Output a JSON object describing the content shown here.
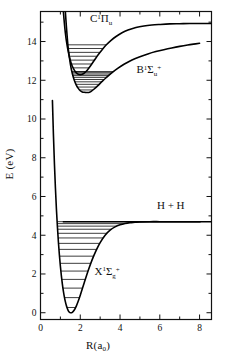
{
  "figure": {
    "kind": "potential-energy-curves",
    "molecule": "H2",
    "background": "#ffffff",
    "line_color": "#000000",
    "level_color": "#1a1a1a"
  },
  "axes": {
    "xlabel_main": "R(a",
    "xlabel_sub": "0",
    "xlabel_close": ")",
    "ylabel": "E (eV)",
    "xticks": [
      0,
      2,
      4,
      6,
      8
    ],
    "xticklabels": [
      "0",
      "2",
      "4",
      "6",
      "8"
    ],
    "yticks": [
      0,
      2,
      4,
      6,
      8,
      10,
      12,
      14
    ],
    "yticklabels": [
      "0",
      "2",
      "4",
      "6",
      "8",
      "10",
      "12",
      "14"
    ],
    "xlim": [
      0,
      8.6
    ],
    "ylim": [
      -0.35,
      15.55
    ],
    "minor_x_step": 1,
    "minor_y_step": 1,
    "grid": false,
    "frame": true
  },
  "annotations": [
    {
      "id": "label-C",
      "base": "C",
      "super": "1",
      "greek": "Π",
      "sub": "u",
      "post": "",
      "x": 3.05,
      "y": 15.0
    },
    {
      "id": "label-B",
      "base": "B",
      "super": "1",
      "greek": "Σ",
      "sub": "u",
      "post": "+",
      "x": 5.45,
      "y": 12.35
    },
    {
      "id": "label-X",
      "base": "X",
      "super": "1",
      "greek": "Σ",
      "sub": "g",
      "post": "+",
      "x": 3.35,
      "y": 1.95
    },
    {
      "id": "label-HH",
      "base": "H + H",
      "super": "",
      "greek": "",
      "sub": "",
      "post": "",
      "x": 6.55,
      "y": 5.35
    }
  ],
  "chart_data": {
    "type": "line",
    "title": "",
    "xlabel": "R(a0)",
    "ylabel": "E (eV)",
    "xlim": [
      0,
      8.6
    ],
    "ylim": [
      -0.35,
      15.55
    ],
    "grid": false,
    "legend": "inline-annotations",
    "series": [
      {
        "name": "X1Sigma_g+",
        "label": "X¹Σₒ⁺",
        "minimum_R": 1.4,
        "minimum_E": 0.0,
        "dissociation_E": 4.7,
        "x": [
          0.6,
          0.65,
          0.7,
          0.75,
          0.8,
          0.85,
          0.9,
          0.95,
          1.0,
          1.05,
          1.1,
          1.15,
          1.2,
          1.25,
          1.3,
          1.35,
          1.4,
          1.45,
          1.5,
          1.6,
          1.7,
          1.8,
          1.9,
          2.0,
          2.2,
          2.4,
          2.6,
          2.8,
          3.0,
          3.25,
          3.5,
          3.75,
          4.0,
          4.25,
          4.5,
          4.75,
          5.0,
          5.5,
          6.0,
          6.5,
          7.0,
          7.5,
          8.0,
          8.6
        ],
        "y": [
          10.95,
          9.2,
          7.7,
          6.45,
          5.35,
          4.45,
          3.65,
          2.98,
          2.4,
          1.9,
          1.48,
          1.12,
          0.82,
          0.57,
          0.37,
          0.22,
          0.1,
          0.03,
          0.0,
          0.02,
          0.14,
          0.34,
          0.6,
          0.9,
          1.55,
          2.18,
          2.74,
          3.22,
          3.62,
          4.0,
          4.26,
          4.43,
          4.54,
          4.61,
          4.65,
          4.67,
          4.69,
          4.7,
          4.7,
          4.7,
          4.7,
          4.7,
          4.7,
          4.7
        ],
        "vibrational_levels": [
          0.27,
          0.78,
          1.27,
          1.72,
          2.15,
          2.55,
          2.92,
          3.27,
          3.58,
          3.86,
          4.1,
          4.31,
          4.47,
          4.6,
          4.7
        ],
        "level_count": 15
      },
      {
        "name": "B1Sigma_u+",
        "label": "B¹Σᵤ⁺",
        "minimum_R": 2.45,
        "minimum_E": 11.38,
        "x": [
          1.25,
          1.3,
          1.35,
          1.4,
          1.5,
          1.6,
          1.7,
          1.8,
          1.9,
          2.0,
          2.1,
          2.2,
          2.3,
          2.4,
          2.45,
          2.55,
          2.7,
          2.9,
          3.1,
          3.3,
          3.6,
          3.9,
          4.2,
          4.6,
          5.0,
          5.4,
          5.8,
          6.2,
          6.6,
          7.0,
          7.4,
          7.8,
          8.0
        ],
        "y": [
          15.55,
          14.8,
          14.15,
          13.6,
          12.85,
          12.35,
          12.0,
          11.75,
          11.58,
          11.46,
          11.4,
          11.38,
          11.37,
          11.37,
          11.38,
          11.43,
          11.55,
          11.74,
          11.94,
          12.13,
          12.4,
          12.63,
          12.83,
          13.05,
          13.22,
          13.36,
          13.48,
          13.58,
          13.67,
          13.75,
          13.82,
          13.88,
          13.91
        ],
        "vibrational_levels": [
          11.5,
          11.65,
          11.79,
          11.92,
          12.04,
          12.15,
          12.24,
          12.32,
          12.39,
          12.45
        ],
        "level_count": 10
      },
      {
        "name": "C1Pi_u",
        "label": "C¹Πᵤ",
        "minimum_R": 2.0,
        "minimum_E": 12.29,
        "asymptote_E": 14.93,
        "x": [
          1.15,
          1.2,
          1.25,
          1.3,
          1.4,
          1.5,
          1.6,
          1.7,
          1.8,
          1.9,
          2.0,
          2.1,
          2.2,
          2.35,
          2.5,
          2.7,
          2.9,
          3.1,
          3.3,
          3.55,
          3.8,
          4.1,
          4.4,
          4.8,
          5.2,
          5.6,
          6.0,
          6.5,
          7.0,
          7.5,
          8.0,
          8.6
        ],
        "y": [
          15.55,
          14.95,
          14.45,
          14.05,
          13.45,
          13.02,
          12.72,
          12.52,
          12.38,
          12.31,
          12.29,
          12.31,
          12.37,
          12.52,
          12.72,
          13.02,
          13.32,
          13.58,
          13.82,
          14.06,
          14.26,
          14.45,
          14.59,
          14.72,
          14.8,
          14.85,
          14.88,
          14.91,
          14.92,
          14.93,
          14.93,
          14.93
        ],
        "vibrational_levels": [
          12.45,
          12.64,
          12.84,
          13.04,
          13.24,
          13.44,
          13.64,
          13.83
        ],
        "level_count": 8
      }
    ],
    "asymptote_lines": [
      {
        "name": "H+H-dissociation",
        "energy": 4.7,
        "from_R": 1.12,
        "to_R": 8.05
      }
    ]
  }
}
